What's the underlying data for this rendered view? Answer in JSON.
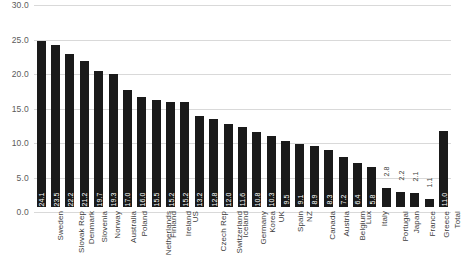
{
  "chart_data": {
    "type": "bar",
    "title": "",
    "subtitle": "",
    "xlabel": "",
    "ylabel": "",
    "ylim": [
      0.0,
      30.0
    ],
    "ytick_labels": [
      "0.0",
      "5.0",
      "10.0",
      "15.0",
      "20.0",
      "25.0",
      "30.0"
    ],
    "ytick_values": [
      0.0,
      5.0,
      10.0,
      15.0,
      20.0,
      25.0,
      30.0
    ],
    "grid": true,
    "legend": "none",
    "bar_color": "#1a1a1a",
    "gridline_color": "#d9d9d9",
    "value_label_color": "#ffffff",
    "categories": [
      "Sweden",
      "Slovak Rep",
      "Denmark",
      "Slovenia",
      "Norway",
      "Australia",
      "Poland",
      "Netherlands",
      "Finland",
      "Ireland",
      "US",
      "Czech Rep",
      "Switzerland",
      "Iceland",
      "Germany",
      "Korea",
      "UK",
      "Spain",
      "NZ",
      "Canada",
      "Austria",
      "Belgium",
      "Lux",
      "Italy",
      "Portugal",
      "Japan",
      "France",
      "Greece",
      "Total"
    ],
    "values": [
      24.1,
      23.5,
      22.2,
      21.2,
      19.7,
      19.3,
      17.0,
      16.0,
      15.5,
      15.2,
      15.2,
      13.2,
      12.8,
      12.0,
      11.6,
      10.8,
      10.3,
      9.5,
      9.1,
      8.9,
      8.3,
      7.2,
      6.4,
      5.8,
      2.8,
      2.2,
      2.1,
      1.1,
      11.0
    ],
    "value_labels": [
      "24.1",
      "23.5",
      "22.2",
      "21.2",
      "19.7",
      "19.3",
      "17.0",
      "16.0",
      "15.5",
      "15.2",
      "15.2",
      "13.2",
      "12.8",
      "12.0",
      "11.6",
      "10.8",
      "10.3",
      "9.5",
      "9.1",
      "8.9",
      "8.3",
      "7.2",
      "6.4",
      "5.8",
      "2.8",
      "2.2",
      "2.1",
      "1.1",
      "11.0"
    ]
  }
}
